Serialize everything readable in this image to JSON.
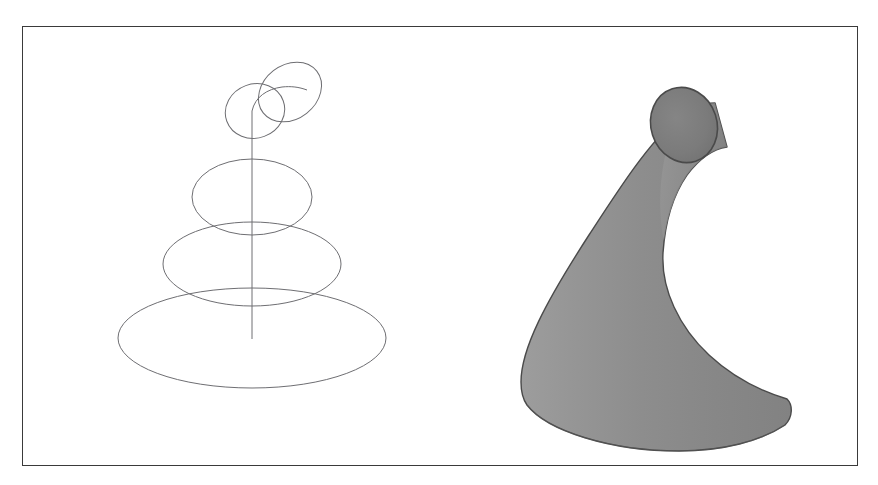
{
  "figure": {
    "background_color": "#ffffff",
    "frame_color": "#3a3a3a",
    "frame_width_px": 836,
    "frame_height_px": 440,
    "panel_count": 2
  },
  "chart_data": {
    "type": "scatter",
    "title": "",
    "subtitle": "",
    "xlabel": "",
    "ylabel": "",
    "grid": false,
    "legend": null,
    "description": "Two side-by-side renderings of a surface of revolution shaped like a curled horn or bell: left is a wireframe of circular cross-sections strung along a curved spine axis, right is the shaded solid surface.",
    "panels": [
      {
        "name": "wireframe",
        "render_style": "wireframe",
        "stroke_color": "#6e6e72",
        "stroke_width": 1.0,
        "fill": "none",
        "axis_line": {
          "name": "spine-axis",
          "x": 251,
          "y_top": 110,
          "y_bottom": 338,
          "color": "#6e6e72"
        },
        "cross_sections": [
          {
            "index": 0,
            "label": "tip-ring-upper",
            "cx": 289,
            "cy": 91,
            "rx": 34,
            "ry": 27,
            "rotation_deg": -38
          },
          {
            "index": 1,
            "label": "tip-ring-lower",
            "cx": 254,
            "cy": 110,
            "rx": 30,
            "ry": 27,
            "rotation_deg": -20
          },
          {
            "index": 2,
            "label": "ring-3",
            "cx": 251,
            "cy": 196,
            "rx": 60,
            "ry": 38,
            "rotation_deg": 0
          },
          {
            "index": 3,
            "label": "ring-2",
            "cx": 251,
            "cy": 263,
            "rx": 89,
            "ry": 42,
            "rotation_deg": 0
          },
          {
            "index": 4,
            "label": "ring-1-base",
            "cx": 251,
            "cy": 337,
            "rx": 134,
            "ry": 50,
            "rotation_deg": 0
          }
        ]
      },
      {
        "name": "solid",
        "render_style": "shaded-surface",
        "fill_color_light": "#9a9a9a",
        "fill_color_mid": "#8b8b8b",
        "fill_color_dark": "#7a7a7a",
        "outline_color": "#4a4a4a",
        "outline_width": 1.4,
        "tip_cap": {
          "label": "tip-cap-ellipse",
          "cx": 683,
          "cy": 124,
          "rx": 33,
          "ry": 38,
          "rotation_deg": -18,
          "fill": "#787878"
        },
        "base": {
          "label": "base-ellipse",
          "cx": 634,
          "cy": 398,
          "rx": 136,
          "ry": 44
        },
        "silhouette_extents": {
          "left_px": 498,
          "right_px": 770,
          "top_px": 86,
          "bottom_px": 442
        }
      }
    ]
  }
}
